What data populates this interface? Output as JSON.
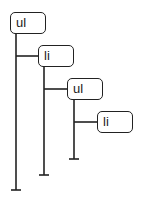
{
  "diagram": {
    "type": "tree",
    "nodes": [
      {
        "id": "n1",
        "label": "ul",
        "depth": 0
      },
      {
        "id": "n2",
        "label": "li",
        "depth": 1,
        "parent": "n1"
      },
      {
        "id": "n3",
        "label": "ul",
        "depth": 2,
        "parent": "n2"
      },
      {
        "id": "n4",
        "label": "li",
        "depth": 3,
        "parent": "n3"
      }
    ],
    "colors": {
      "stroke": "#222222",
      "background": "#ffffff"
    }
  }
}
